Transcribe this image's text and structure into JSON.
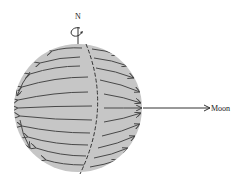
{
  "diagram": {
    "labels": {
      "north": "N",
      "moon": "Moon"
    },
    "colors": {
      "sphere_fill": "#c6c6c6",
      "arrow": "#444444",
      "line": "#333333"
    }
  }
}
